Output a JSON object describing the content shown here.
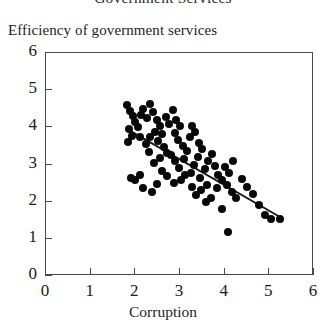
{
  "figure": {
    "title": "Government Services",
    "title_clipped": true
  },
  "chart_data": {
    "type": "scatter",
    "title": "Government Services",
    "xlabel": "Corruption",
    "ylabel": "Efficiency of government services",
    "xlim": [
      0,
      6
    ],
    "ylim": [
      0,
      6
    ],
    "xticks": [
      "0",
      "1",
      "2",
      "3",
      "4",
      "5",
      "6"
    ],
    "yticks": [
      "0",
      "1",
      "2",
      "3",
      "4",
      "5",
      "6"
    ],
    "xtick_values": [
      0,
      1,
      2,
      3,
      4,
      5,
      6
    ],
    "ytick_values": [
      0,
      1,
      2,
      3,
      4,
      5,
      6
    ],
    "grid": false,
    "legend": null,
    "marker": {
      "shape": "circle",
      "color": "#080808",
      "size_px": 8
    },
    "trend_line": {
      "type": "linear-fit",
      "color": "#1a1a1a",
      "width_px": 2,
      "x_start": 1.85,
      "y_start": 3.92,
      "x_end": 5.32,
      "y_end": 1.52
    },
    "points": [
      [
        1.83,
        4.58
      ],
      [
        1.9,
        4.42
      ],
      [
        1.96,
        4.28
      ],
      [
        2.02,
        4.12
      ],
      [
        1.88,
        3.92
      ],
      [
        1.95,
        3.75
      ],
      [
        1.86,
        3.58
      ],
      [
        2.08,
        3.98
      ],
      [
        2.14,
        4.3
      ],
      [
        2.2,
        4.46
      ],
      [
        2.28,
        4.22
      ],
      [
        2.12,
        3.7
      ],
      [
        1.92,
        2.62
      ],
      [
        2.02,
        2.55
      ],
      [
        2.12,
        2.68
      ],
      [
        2.34,
        4.6
      ],
      [
        2.42,
        4.38
      ],
      [
        2.5,
        4.18
      ],
      [
        2.58,
        4.02
      ],
      [
        2.46,
        3.86
      ],
      [
        2.36,
        3.72
      ],
      [
        2.54,
        3.6
      ],
      [
        2.62,
        3.8
      ],
      [
        2.7,
        4.24
      ],
      [
        2.78,
        4.06
      ],
      [
        2.66,
        3.44
      ],
      [
        2.74,
        3.28
      ],
      [
        2.58,
        3.14
      ],
      [
        2.44,
        3.02
      ],
      [
        2.32,
        3.3
      ],
      [
        2.26,
        3.52
      ],
      [
        2.86,
        4.44
      ],
      [
        2.94,
        4.16
      ],
      [
        3.02,
        4.0
      ],
      [
        2.9,
        3.82
      ],
      [
        2.98,
        3.62
      ],
      [
        3.08,
        3.46
      ],
      [
        2.82,
        3.24
      ],
      [
        2.92,
        3.06
      ],
      [
        3.0,
        2.88
      ],
      [
        3.12,
        3.12
      ],
      [
        3.18,
        3.34
      ],
      [
        3.24,
        3.7
      ],
      [
        3.3,
        4.02
      ],
      [
        3.36,
        3.86
      ],
      [
        3.14,
        2.7
      ],
      [
        3.04,
        2.56
      ],
      [
        2.88,
        2.48
      ],
      [
        2.74,
        2.66
      ],
      [
        2.62,
        2.8
      ],
      [
        2.5,
        2.44
      ],
      [
        3.44,
        3.56
      ],
      [
        3.52,
        3.38
      ],
      [
        3.42,
        3.18
      ],
      [
        3.34,
        2.96
      ],
      [
        3.26,
        2.74
      ],
      [
        3.48,
        2.6
      ],
      [
        3.58,
        2.84
      ],
      [
        3.66,
        3.06
      ],
      [
        3.74,
        3.26
      ],
      [
        3.62,
        2.42
      ],
      [
        3.5,
        2.28
      ],
      [
        3.38,
        2.16
      ],
      [
        3.8,
        2.92
      ],
      [
        3.88,
        2.7
      ],
      [
        3.96,
        2.56
      ],
      [
        3.86,
        2.34
      ],
      [
        3.72,
        2.08
      ],
      [
        3.6,
        1.96
      ],
      [
        4.02,
        2.9
      ],
      [
        4.12,
        2.74
      ],
      [
        4.22,
        3.06
      ],
      [
        4.08,
        2.42
      ],
      [
        4.18,
        2.24
      ],
      [
        4.28,
        2.06
      ],
      [
        4.1,
        1.15
      ],
      [
        4.4,
        2.58
      ],
      [
        4.52,
        2.36
      ],
      [
        4.66,
        2.18
      ],
      [
        4.78,
        1.88
      ],
      [
        4.92,
        1.62
      ],
      [
        5.06,
        1.5
      ],
      [
        5.26,
        1.5
      ],
      [
        2.2,
        2.34
      ],
      [
        2.4,
        2.22
      ],
      [
        3.96,
        1.78
      ],
      [
        3.3,
        2.38
      ]
    ],
    "n_points": 88
  },
  "axes": {
    "x_title": "Corruption",
    "y_title": "Efficiency of government services"
  }
}
